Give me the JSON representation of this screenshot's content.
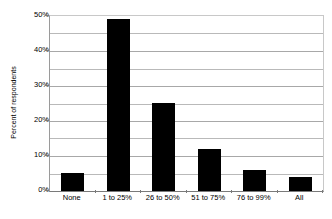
{
  "chart_data": {
    "type": "bar",
    "title": "",
    "subtitle": "",
    "xlabel": "",
    "ylabel": "Percent of respondents",
    "categories": [
      "None",
      "1 to 25%",
      "26 to 50%",
      "51 to 75%",
      "76 to 99%",
      "All"
    ],
    "values": [
      5,
      49,
      25,
      12,
      6,
      4
    ],
    "ylim": [
      0,
      50
    ],
    "ytick_labels": [
      "0%",
      "10%",
      "20%",
      "30%",
      "40%",
      "50%"
    ],
    "ytick_values": [
      0,
      10,
      20,
      30,
      40,
      50
    ],
    "minor_gridline_values": [
      5,
      15,
      25,
      35,
      45
    ],
    "grid": "horizontal",
    "legend": "none",
    "bar_color": "#000000",
    "gridline_color": "#b9b9b9",
    "axis_color": "#7a7a7a",
    "background_color": "#ffffff",
    "text_color": "#000000"
  }
}
